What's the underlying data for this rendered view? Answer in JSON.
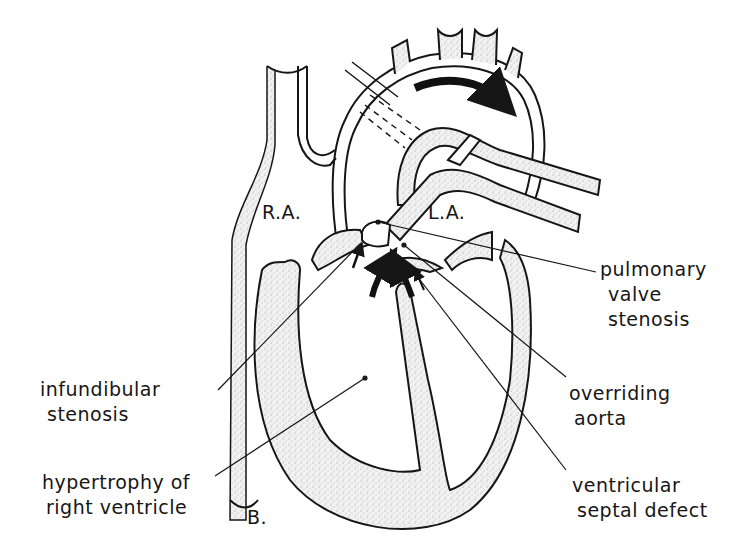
{
  "figure": {
    "panel_letter": "B.",
    "chambers": {
      "right_atrium": "R.A.",
      "left_atrium": "L.A."
    },
    "labels": {
      "pulmonary_valve_stenosis": [
        "pulmonary",
        "valve",
        "stenosis"
      ],
      "infundibular_stenosis": [
        "infundibular",
        "stenosis"
      ],
      "overriding_aorta": [
        "overriding",
        "aorta"
      ],
      "hypertrophy_right_ventricle": [
        "hypertrophy of",
        "right ventricle"
      ],
      "ventricular_septal_defect": [
        "ventricular",
        "septal defect"
      ]
    },
    "colors": {
      "line": "#161616",
      "muscle_stipple": "#d9d9d9",
      "background": "#ffffff"
    }
  }
}
